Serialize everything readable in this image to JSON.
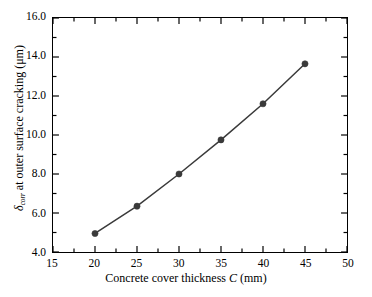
{
  "chart_data": {
    "type": "line",
    "title": "",
    "xlabel": "Concrete cover thickness C (mm)",
    "ylabel": "δcorr at outer surface cracking (μm)",
    "ylabel_symbol": "δ",
    "ylabel_subscript": "corr",
    "ylabel_rest": " at outer surface cracking (μm)",
    "xlabel_prefix": "Concrete cover thickness ",
    "xlabel_var": "C",
    "xlabel_suffix": " (mm)",
    "x": [
      20,
      25,
      30,
      35,
      40,
      45
    ],
    "values": [
      4.95,
      6.35,
      8.0,
      9.75,
      11.6,
      13.65
    ],
    "series": [
      {
        "name": "delta_corr at outer surface cracking",
        "values": [
          4.95,
          6.35,
          8.0,
          9.75,
          11.6,
          13.65
        ]
      }
    ],
    "xlim": [
      15,
      50
    ],
    "ylim": [
      4.0,
      16.0
    ],
    "xticks": [
      15,
      20,
      25,
      30,
      35,
      40,
      45,
      50
    ],
    "xtick_labels": [
      "15",
      "20",
      "25",
      "30",
      "35",
      "40",
      "45",
      "50"
    ],
    "yticks": [
      4.0,
      6.0,
      8.0,
      10.0,
      12.0,
      14.0,
      16.0
    ],
    "ytick_labels": [
      "4.0",
      "6.0",
      "8.0",
      "10.0",
      "12.0",
      "14.0",
      "16.0"
    ],
    "x_minor_step": 2.5,
    "y_minor_step": 1.0,
    "grid": false,
    "legend": false,
    "line_color": "#3a3a3a",
    "marker_color": "#3a3a3a",
    "marker_shape": "circle",
    "frame_color": "#000000",
    "background_color": "#ffffff"
  }
}
